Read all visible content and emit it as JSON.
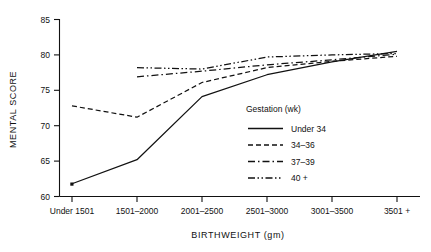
{
  "chart_data": {
    "type": "line",
    "title": "",
    "xlabel": "BIRTHWEIGHT (gm)",
    "ylabel": "MENTAL SCORE",
    "ylim": [
      60,
      85
    ],
    "yticks": [
      60,
      65,
      70,
      75,
      80,
      85
    ],
    "grid": false,
    "legend_position": "inside-right",
    "legend_title": "Gestation (wk)",
    "categories": [
      "Under 1501",
      "1501–2000",
      "2001–2500",
      "2501–3000",
      "3001–3500",
      "3501 +"
    ],
    "series": [
      {
        "name": "Under 34",
        "style": "solid",
        "values": [
          61.8,
          65.2,
          74.1,
          77.2,
          79.0,
          80.5
        ]
      },
      {
        "name": "34–36",
        "style": "dashed",
        "values": [
          72.8,
          71.2,
          76.1,
          78.2,
          79.1,
          79.8
        ]
      },
      {
        "name": "37–39",
        "style": "dash-dot",
        "values": [
          null,
          76.9,
          77.7,
          78.6,
          79.3,
          80.1
        ]
      },
      {
        "name": "40 +",
        "style": "dash-dot-dot",
        "values": [
          null,
          78.2,
          78.0,
          79.7,
          80.0,
          80.2
        ]
      }
    ]
  },
  "axes": {
    "y_label": "MENTAL SCORE",
    "x_label": "BIRTHWEIGHT (gm)",
    "y_tick_labels": [
      "60",
      "65",
      "70",
      "75",
      "80",
      "85"
    ],
    "x_tick_labels": [
      "Under 1501",
      "1501–2000",
      "2001–2500",
      "2501–3000",
      "3001–3500",
      "3501 +"
    ]
  },
  "legend": {
    "title": "Gestation (wk)",
    "items": [
      {
        "label": "Under 34"
      },
      {
        "label": "34–36"
      },
      {
        "label": "37–39"
      },
      {
        "label": "40 +"
      }
    ]
  },
  "colors": {
    "ink": "#111111",
    "background": "#ffffff"
  }
}
